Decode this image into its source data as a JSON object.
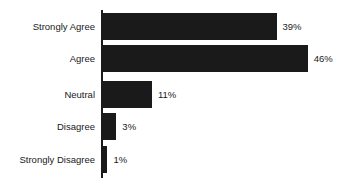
{
  "chart_data": {
    "type": "bar",
    "orientation": "horizontal",
    "title": "",
    "subtitle": "",
    "xlabel": "",
    "ylabel": "",
    "categories": [
      "Strongly Agree",
      "Agree",
      "Neutral",
      "Disagree",
      "Strongly Disagree"
    ],
    "values": [
      39,
      46,
      11,
      3,
      1
    ],
    "value_labels": [
      "39%",
      "46%",
      "11%",
      "3%",
      "1%"
    ],
    "units": "percent",
    "xlim": [
      0,
      46
    ],
    "grid": false,
    "legend": null,
    "series": [
      {
        "name": "Responses",
        "values": [
          39,
          46,
          11,
          3,
          1
        ]
      }
    ],
    "colors": {
      "bar_fill": "#1a1a1a",
      "axis": "#1a1a1a",
      "background": "#ffffff",
      "text": "#1a1a1a"
    }
  },
  "axis": {
    "category_axis_name": "category-axis"
  }
}
